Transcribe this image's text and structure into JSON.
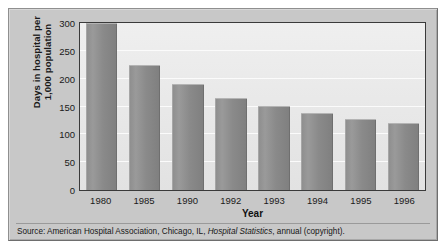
{
  "chart_data": {
    "type": "bar",
    "title": "",
    "xlabel": "Year",
    "ylabel_line1": "Days in hospital per",
    "ylabel_line2": "1,000 population",
    "categories": [
      "1980",
      "1985",
      "1990",
      "1992",
      "1993",
      "1994",
      "1995",
      "1996"
    ],
    "values": [
      300,
      225,
      190,
      165,
      151,
      139,
      128,
      121
    ],
    "ylim": [
      0,
      300
    ],
    "yticks": [
      0,
      50,
      100,
      150,
      200,
      250,
      300
    ],
    "ytick_labels": [
      "0",
      "50",
      "100",
      "150",
      "200",
      "250",
      "300"
    ],
    "grid": "horizontal",
    "legend": "none",
    "series": [
      {
        "name": "Days in hospital per 1,000 population",
        "values": [
          300,
          225,
          190,
          165,
          151,
          139,
          128,
          121
        ]
      }
    ]
  },
  "source": {
    "prefix": "Source: American Hospital Association, Chicago, IL, ",
    "italic": "Hospital Statistics",
    "suffix": ", annual (copyright)."
  },
  "colors": {
    "card_background": "#c8c8c8",
    "plot_background": "#ececec",
    "bar_fill": "#8d8d8d",
    "frame": "#3a3a3a",
    "gridline": "#fbfbfb",
    "text": "#1a1a1a"
  }
}
